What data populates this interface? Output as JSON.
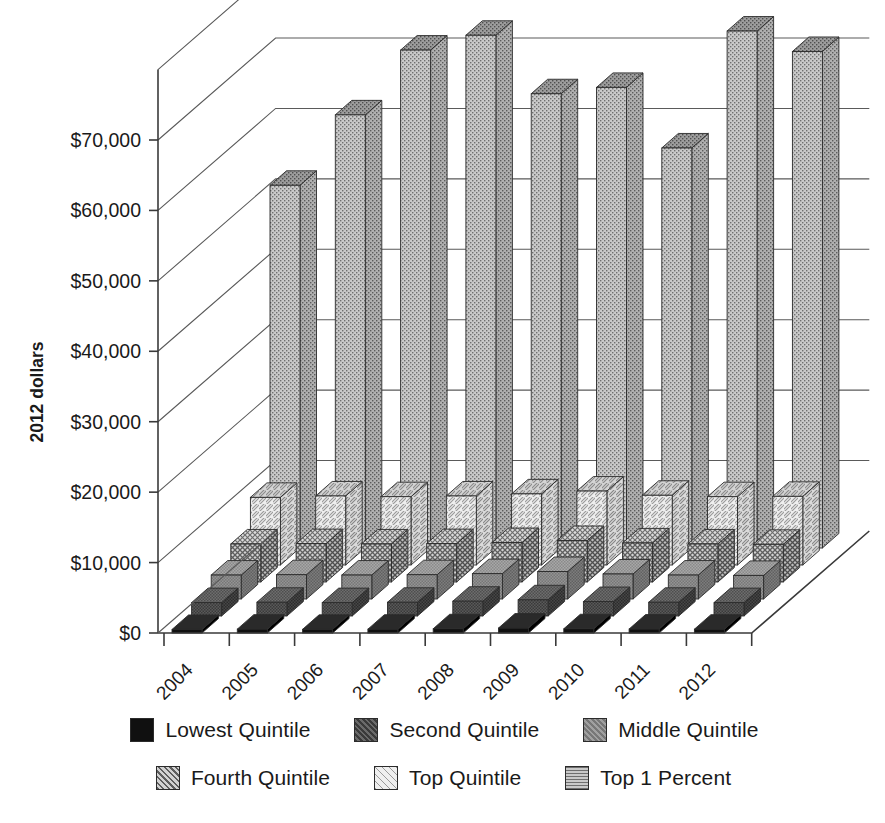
{
  "chart_data": {
    "type": "bar",
    "subtype": "3d-column",
    "title": "",
    "xlabel": "",
    "ylabel": "2012 dollars",
    "ylim": [
      0,
      80000
    ],
    "ytick_step": 10000,
    "grid": true,
    "legend_position": "bottom",
    "categories": [
      "2004",
      "2005",
      "2006",
      "2007",
      "2008",
      "2009",
      "2010",
      "2011",
      "2012"
    ],
    "ytick_labels": [
      "$0",
      "$10,000",
      "$20,000",
      "$30,000",
      "$40,000",
      "$50,000",
      "$60,000",
      "$70,000"
    ],
    "ytick_values": [
      0,
      10000,
      20000,
      30000,
      40000,
      50000,
      60000,
      70000
    ],
    "series": [
      {
        "name": "Lowest Quintile",
        "pattern": "solid-black",
        "color": "#111111",
        "values": [
          500,
          550,
          520,
          540,
          600,
          700,
          600,
          560,
          540
        ]
      },
      {
        "name": "Second Quintile",
        "pattern": "dark-gray",
        "color": "#555555",
        "values": [
          1900,
          1950,
          1900,
          1950,
          2100,
          2300,
          2050,
          1950,
          1900
        ]
      },
      {
        "name": "Middle Quintile",
        "pattern": "medium-gray",
        "color": "#8a8a8a",
        "values": [
          3400,
          3450,
          3400,
          3450,
          3600,
          3900,
          3550,
          3400,
          3350
        ]
      },
      {
        "name": "Fourth Quintile",
        "pattern": "crosshatch",
        "color": "#9a9a9a",
        "values": [
          5400,
          5450,
          5400,
          5450,
          5600,
          5900,
          5550,
          5400,
          5350
        ]
      },
      {
        "name": "Top Quintile",
        "pattern": "light-diagonal",
        "color": "#d8d8d8",
        "values": [
          9600,
          9800,
          9700,
          9800,
          10100,
          10500,
          9900,
          9700,
          9750
        ]
      },
      {
        "name": "Top 1 Percent",
        "pattern": "stipple",
        "color": "#b8b8b8",
        "values": [
          51500,
          61500,
          70700,
          72800,
          64500,
          65400,
          56800,
          73400,
          70500
        ]
      }
    ]
  },
  "axes": {
    "y_axis_title": "2012 dollars"
  },
  "legend": {
    "rows": [
      [
        {
          "label": "Lowest Quintile",
          "pattern": "solid-black"
        },
        {
          "label": "Second Quintile",
          "pattern": "dark-gray"
        },
        {
          "label": "Middle Quintile",
          "pattern": "medium-gray"
        }
      ],
      [
        {
          "label": "Fourth Quintile",
          "pattern": "crosshatch"
        },
        {
          "label": "Top Quintile",
          "pattern": "light-diagonal"
        },
        {
          "label": "Top 1 Percent",
          "pattern": "stipple"
        }
      ]
    ]
  }
}
